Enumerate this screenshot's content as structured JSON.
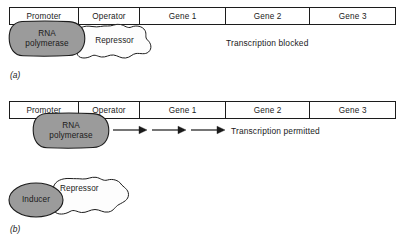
{
  "figure": {
    "type": "diagram",
    "panels": [
      {
        "id": "a",
        "label": "(a)",
        "bar_segments": [
          {
            "name": "promoter",
            "label": "Promoter"
          },
          {
            "name": "operator",
            "label": "Operator"
          },
          {
            "name": "gene1",
            "label": "Gene 1"
          },
          {
            "name": "gene2",
            "label": "Gene 2"
          },
          {
            "name": "gene3",
            "label": "Gene 3"
          }
        ],
        "shapes": [
          {
            "name": "rna-polymerase",
            "line1": "RNA",
            "line2": "polymerase",
            "fill": "#9b9b9b"
          },
          {
            "name": "repressor",
            "line1": "Repressor",
            "line2": "",
            "fill": "#fdfdfd"
          }
        ],
        "status": "Transcription blocked",
        "arrows": 0
      },
      {
        "id": "b",
        "label": "(b)",
        "bar_segments": [
          {
            "name": "promoter",
            "label": "Promoter"
          },
          {
            "name": "operator",
            "label": "Operator"
          },
          {
            "name": "gene1",
            "label": "Gene 1"
          },
          {
            "name": "gene2",
            "label": "Gene 2"
          },
          {
            "name": "gene3",
            "label": "Gene 3"
          }
        ],
        "shapes": [
          {
            "name": "rna-polymerase",
            "line1": "RNA",
            "line2": "polymerase",
            "fill": "#9b9b9b"
          },
          {
            "name": "inducer",
            "line1": "Inducer",
            "line2": "",
            "fill": "#9b9b9b"
          },
          {
            "name": "repressor",
            "line1": "Repressor",
            "line2": "",
            "fill": "#fdfdfd"
          }
        ],
        "status": "Transcription permitted",
        "arrows": 3
      }
    ],
    "colors": {
      "shape_gray": "#9b9b9b",
      "shape_white": "#fdfdfd",
      "outline": "#1c1c1c",
      "text": "#1a1a1a",
      "background": "#ffffff"
    }
  }
}
